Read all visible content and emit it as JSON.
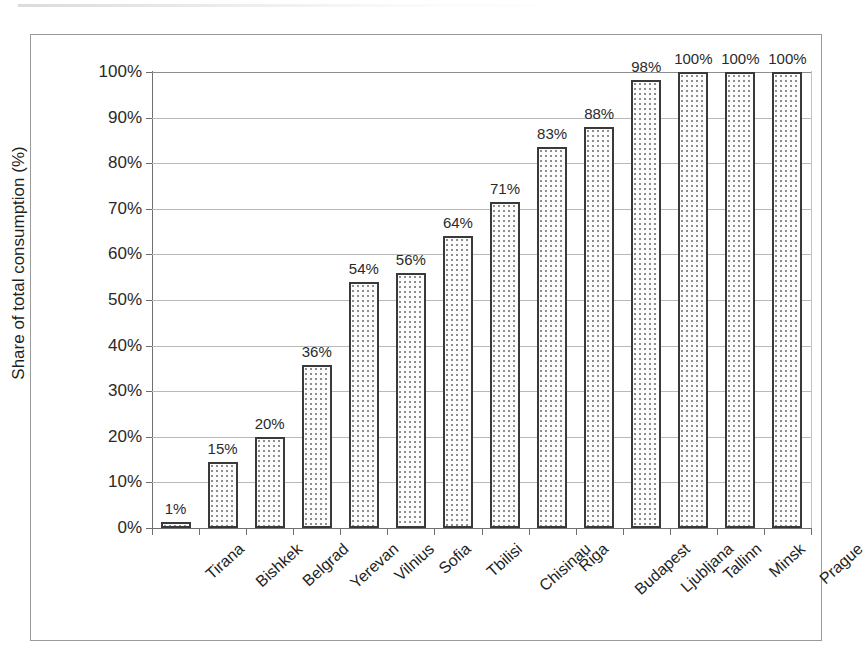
{
  "chart_data": {
    "type": "bar",
    "title": "",
    "xlabel": "",
    "ylabel": "Share of total consumption (%)",
    "ylim": [
      0,
      100
    ],
    "ytick_labels": [
      "0%",
      "10%",
      "20%",
      "30%",
      "40%",
      "50%",
      "60%",
      "70%",
      "80%",
      "90%",
      "100%"
    ],
    "ytick_values": [
      0,
      10,
      20,
      30,
      40,
      50,
      60,
      70,
      80,
      90,
      100
    ],
    "grid": "horizontal",
    "legend": "none",
    "categories": [
      "Tirana",
      "Bishkek",
      "Belgrad",
      "Yerevan",
      "Vilnius",
      "Sofia",
      "Tbilisi",
      "Chisinau",
      "Riga",
      "Budapest",
      "Ljubljana",
      "Tallinn",
      "Minsk",
      "Prague"
    ],
    "values": [
      1,
      15,
      20,
      36,
      54,
      56,
      64,
      71,
      83,
      88,
      98,
      100,
      100,
      100
    ],
    "bar_heights": [
      1.4,
      14.5,
      20.0,
      35.8,
      54.0,
      56.0,
      64.0,
      71.4,
      83.5,
      88.0,
      98.3,
      100,
      100,
      100
    ],
    "data_labels": [
      "1%",
      "15%",
      "20%",
      "36%",
      "54%",
      "56%",
      "64%",
      "71%",
      "83%",
      "88%",
      "98%",
      "100%",
      "100%",
      "100%"
    ],
    "colors": {
      "bar_border": "#3a3a3a",
      "bar_fill": "#fdfdfd",
      "bar_pattern_dot": "#8e8e8e",
      "gridline": "#b9b9b9",
      "axis": "#6f6f6f",
      "text": "#1f1f1f",
      "frame": "#9a9a9a"
    }
  }
}
